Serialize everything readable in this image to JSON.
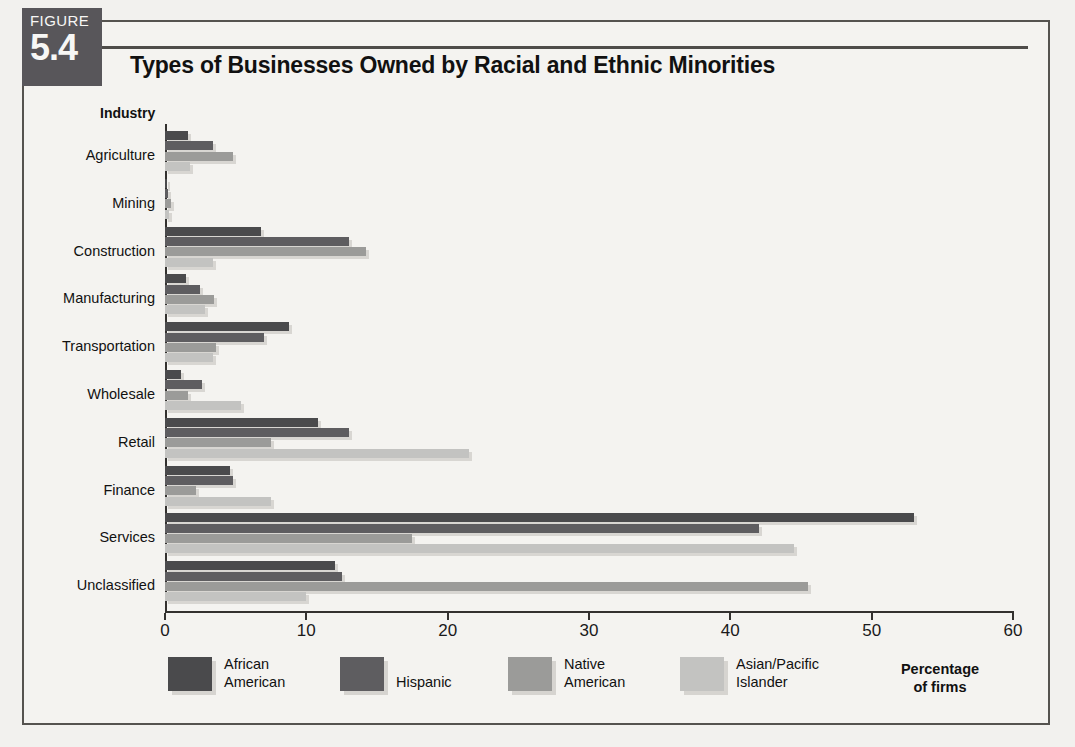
{
  "figure": {
    "tag_label": "FIGURE",
    "tag_number": "5.4",
    "title": "Types of Businesses Owned by Racial and Ethnic Minorities"
  },
  "axis_caption_line1": "Percentage",
  "axis_caption_line2": "of firms",
  "category_axis_title": "Industry",
  "colors": {
    "african_american": "#4a4a4c",
    "hispanic": "#5e5d60",
    "native_american": "#9b9b99",
    "asian_pacific_islander": "#c3c3c1",
    "axis": "#33312f",
    "tag_background": "#58565a",
    "frame": "#55534f"
  },
  "chart_data": {
    "type": "bar",
    "orientation": "horizontal",
    "title": "Types of Businesses Owned by Racial and Ethnic Minorities",
    "xlabel": "Percentage of firms",
    "ylabel": "Industry",
    "xlim": [
      0,
      60
    ],
    "xticks": [
      0,
      10,
      20,
      30,
      40,
      50,
      60
    ],
    "grid": false,
    "legend_position": "bottom",
    "categories": [
      "Agriculture",
      "Mining",
      "Construction",
      "Manufacturing",
      "Transportation",
      "Wholesale",
      "Retail",
      "Finance",
      "Services",
      "Unclassified"
    ],
    "series": [
      {
        "name": "African American",
        "color": "#4a4a4c",
        "values": [
          1.6,
          0.1,
          6.8,
          1.5,
          8.8,
          1.1,
          10.8,
          4.6,
          53.0,
          12.0
        ]
      },
      {
        "name": "Hispanic",
        "color": "#5e5d60",
        "values": [
          3.4,
          0.2,
          13.0,
          2.5,
          7.0,
          2.6,
          13.0,
          4.8,
          42.0,
          12.5
        ]
      },
      {
        "name": "Native American",
        "color": "#9b9b99",
        "values": [
          4.8,
          0.4,
          14.2,
          3.5,
          3.6,
          1.6,
          7.5,
          2.2,
          17.5,
          45.5
        ]
      },
      {
        "name": "Asian/Pacific Islander",
        "color": "#c3c3c1",
        "values": [
          1.8,
          0.3,
          3.4,
          2.8,
          3.4,
          5.4,
          21.5,
          7.5,
          44.5,
          10.0
        ]
      }
    ]
  }
}
